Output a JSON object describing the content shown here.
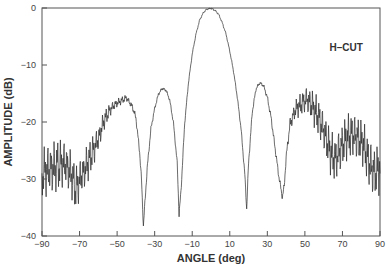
{
  "chart_data": {
    "type": "line",
    "title": "",
    "xlabel": "ANGLE (deg)",
    "ylabel": "AMPLITUDE (dB)",
    "xlim": [
      -90,
      90
    ],
    "ylim": [
      -40,
      0
    ],
    "xticks": [
      -90,
      -70,
      -50,
      -30,
      -10,
      10,
      30,
      50,
      70,
      90
    ],
    "yticks": [
      0,
      -10,
      -20,
      -30,
      -40
    ],
    "xtick_labels": [
      "−90",
      "−70",
      "−50",
      "−30",
      "−10",
      "10",
      "30",
      "50",
      "70",
      "90"
    ],
    "ytick_labels": [
      "0",
      "−10",
      "−20",
      "−30",
      "−40"
    ],
    "grid": false,
    "legend": null,
    "annotations": [
      {
        "text": "H–CUT",
        "x": 72,
        "y": -7.5
      }
    ],
    "series": [
      {
        "name": "H-CUT pattern",
        "x": [
          -90,
          -87,
          -84,
          -81,
          -78,
          -75,
          -72,
          -69,
          -66,
          -63,
          -60,
          -57,
          -54,
          -51,
          -48,
          -45,
          -42,
          -40,
          -38,
          -37,
          -36,
          -34,
          -32,
          -30,
          -28,
          -26,
          -24,
          -22,
          -20,
          -18,
          -17,
          -16,
          -14,
          -12,
          -10,
          -8,
          -6,
          -4,
          -2,
          0,
          2,
          4,
          6,
          8,
          10,
          12,
          14,
          16,
          18,
          19,
          20,
          22,
          24,
          26,
          28,
          30,
          32,
          34,
          36,
          38,
          39,
          40,
          42,
          45,
          48,
          51,
          54,
          57,
          60,
          63,
          66,
          69,
          72,
          75,
          78,
          81,
          84,
          87,
          90
        ],
        "values": [
          -27,
          -26.5,
          -26,
          -25.5,
          -25.5,
          -27,
          -30,
          -28,
          -26,
          -24,
          -22,
          -19,
          -17.5,
          -16.5,
          -16,
          -15.5,
          -17,
          -19,
          -25,
          -30,
          -38,
          -28,
          -21,
          -17.5,
          -15,
          -14,
          -14.3,
          -16,
          -20,
          -27,
          -36,
          -32,
          -20,
          -13,
          -8,
          -4.5,
          -2,
          -0.7,
          -0.1,
          0,
          -0.3,
          -1,
          -2.5,
          -4.5,
          -7.5,
          -11,
          -15.5,
          -21,
          -29,
          -35,
          -27,
          -18,
          -14,
          -13,
          -13.5,
          -15.5,
          -19,
          -24,
          -29,
          -33,
          -31,
          -26,
          -20,
          -17,
          -16,
          -15,
          -16,
          -17.5,
          -20,
          -23,
          -25,
          -23,
          -21,
          -20.5,
          -21,
          -22,
          -25,
          -27,
          -26
        ],
        "ripple_db": [
          8,
          8,
          8,
          8,
          7,
          7,
          7,
          6,
          6,
          5,
          4,
          3,
          2,
          1.5,
          1.2,
          1,
          1,
          1,
          1,
          1,
          1,
          1,
          0.8,
          0.6,
          0.5,
          0.5,
          0.5,
          0.5,
          0.6,
          0.8,
          1,
          1,
          0.6,
          0.4,
          0.3,
          0.3,
          0.3,
          0.3,
          0.3,
          0.3,
          0.3,
          0.3,
          0.3,
          0.3,
          0.3,
          0.4,
          0.5,
          0.6,
          0.8,
          1,
          1,
          0.8,
          0.6,
          0.5,
          0.6,
          0.8,
          1,
          1,
          1,
          1,
          1,
          1.2,
          2,
          3,
          3.5,
          4,
          5,
          6,
          6,
          7,
          7,
          7,
          7,
          7,
          7,
          7,
          8,
          8,
          8
        ]
      }
    ]
  },
  "plot": {
    "left": 42,
    "right": 380,
    "top": 8,
    "bottom": 236,
    "line_color": "#2b2b2b",
    "axis_color": "#555555"
  }
}
